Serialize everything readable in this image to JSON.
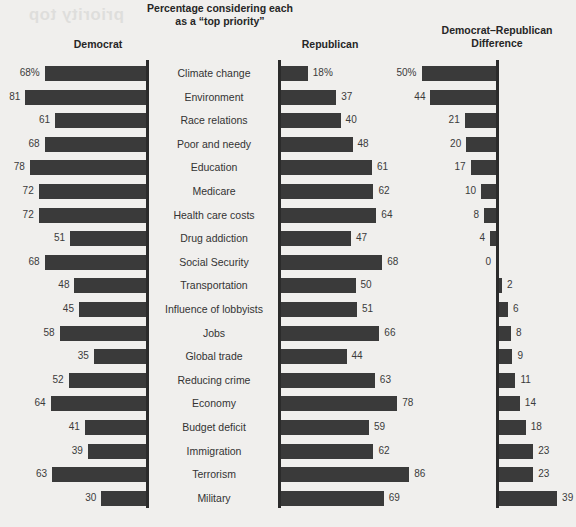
{
  "bleed_text": "priority top",
  "chart_data": {
    "type": "bar",
    "title": "Percentage considering each as a “top priority”",
    "title_line1": "Percentage considering each",
    "title_line2": "as a “top priority”",
    "panels": [
      {
        "key": "democrat",
        "label": "Democrat",
        "direction": "left"
      },
      {
        "key": "republican",
        "label": "Republican",
        "direction": "right"
      },
      {
        "key": "difference",
        "label": "Democrat–Republican Difference",
        "label_line1": "Democrat–Republican",
        "label_line2": "Difference",
        "direction": "diverging"
      }
    ],
    "categories": [
      "Climate change",
      "Environment",
      "Race relations",
      "Poor and needy",
      "Education",
      "Medicare",
      "Health care costs",
      "Drug addiction",
      "Social Security",
      "Transportation",
      "Influence of lobbyists",
      "Jobs",
      "Global trade",
      "Reducing crime",
      "Economy",
      "Budget deficit",
      "Immigration",
      "Terrorism",
      "Military"
    ],
    "series": [
      {
        "name": "Democrat",
        "values": [
          68,
          81,
          61,
          68,
          78,
          72,
          72,
          51,
          68,
          48,
          45,
          58,
          35,
          52,
          64,
          41,
          39,
          63,
          30
        ]
      },
      {
        "name": "Republican",
        "values": [
          18,
          37,
          40,
          48,
          61,
          62,
          64,
          47,
          68,
          50,
          51,
          66,
          44,
          63,
          78,
          59,
          62,
          86,
          69
        ]
      },
      {
        "name": "Democrat–Republican Difference",
        "values": [
          50,
          44,
          21,
          20,
          17,
          10,
          8,
          4,
          0,
          -2,
          -6,
          -8,
          -9,
          -11,
          -14,
          -18,
          -23,
          -23,
          -39
        ]
      }
    ],
    "value_labels": {
      "democrat": [
        "68%",
        "81",
        "61",
        "68",
        "78",
        "72",
        "72",
        "51",
        "68",
        "48",
        "45",
        "58",
        "35",
        "52",
        "64",
        "41",
        "39",
        "63",
        "30"
      ],
      "republican": [
        "18%",
        "37",
        "40",
        "48",
        "61",
        "62",
        "64",
        "47",
        "68",
        "50",
        "51",
        "66",
        "44",
        "63",
        "78",
        "59",
        "62",
        "86",
        "69"
      ],
      "difference": [
        "50%",
        "44",
        "21",
        "20",
        "17",
        "10",
        "8",
        "4",
        "0",
        "2",
        "6",
        "8",
        "9",
        "11",
        "14",
        "18",
        "23",
        "23",
        "39"
      ]
    },
    "units": "percent",
    "xlabel": "",
    "ylabel": "",
    "grid": false,
    "legend": "none",
    "colors": {
      "bar": "#3a3a3a",
      "axis": "#2b2b2b",
      "background": "#f0efed",
      "text": "#333333"
    }
  }
}
